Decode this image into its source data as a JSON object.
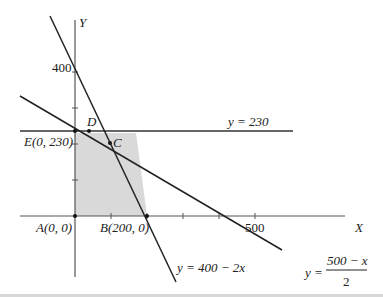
{
  "diagram": {
    "type": "linear-programming-feasible-region",
    "axes": {
      "x_label": "X",
      "y_label": "Y"
    },
    "tick_labels": {
      "y_400": "400",
      "x_500": "500"
    },
    "points": {
      "A": "A(0, 0)",
      "B": "B(200, 0)",
      "C": "C",
      "D": "D",
      "E": "E(0, 230)"
    },
    "lines": {
      "horizontal": "y = 230",
      "steep": "y = 400 − 2x",
      "shallow_prefix": "y =",
      "shallow_numerator": "500 − x",
      "shallow_denominator": "2"
    },
    "colors": {
      "region_fill": "#d9d9d9",
      "line": "#222222",
      "axis": "#555555"
    }
  }
}
